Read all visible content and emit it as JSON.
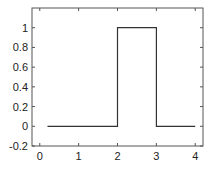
{
  "chart_data": {
    "type": "line",
    "title": "",
    "xlabel": "",
    "ylabel": "",
    "xlim": [
      -0.2,
      4.2
    ],
    "ylim": [
      -0.2,
      1.2
    ],
    "grid": false,
    "legend": null,
    "x_ticks": [
      "0",
      "1",
      "2",
      "3",
      "4"
    ],
    "y_ticks": [
      "-0.2",
      "0",
      "0.2",
      "0.4",
      "0.6",
      "0.8",
      "1"
    ],
    "series": [
      {
        "name": "rectangular pulse",
        "color": "#333333",
        "x": [
          0.2,
          2,
          2,
          3,
          3,
          4
        ],
        "y": [
          0,
          0,
          1,
          1,
          0,
          0
        ]
      }
    ]
  }
}
